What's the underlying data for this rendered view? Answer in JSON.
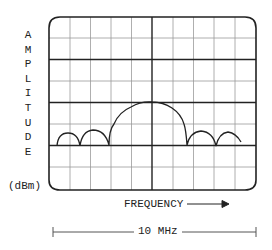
{
  "diagram": {
    "type": "spectrum-analyzer-display",
    "y_axis": {
      "letters": [
        "A",
        "M",
        "P",
        "L",
        "I",
        "T",
        "U",
        "D",
        "E"
      ],
      "label": "AMPLITUDE",
      "unit": "(dBm)"
    },
    "x_axis": {
      "label": "FREQUENCY",
      "span_label": "10 MHz"
    },
    "graticule": {
      "columns": 10,
      "rows": 8
    },
    "trace": {
      "description": "sinc-shaped spectrum: tall main lobe centered, two sidelobes on each side",
      "lobes": [
        "sidelobe",
        "sidelobe",
        "main-lobe",
        "sidelobe",
        "sidelobe"
      ]
    },
    "colors": {
      "line": "#222222",
      "grid_minor": "#9a9a9a",
      "background": "#ffffff"
    }
  }
}
